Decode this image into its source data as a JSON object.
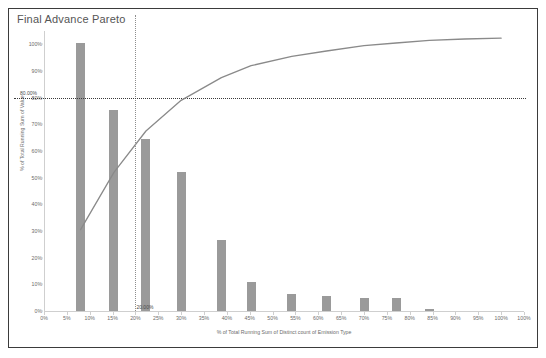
{
  "chart_title": "Final Advance Pareto",
  "axis": {
    "y_title": "% of Total Running Sum of Value",
    "x_title": "% of Total Running Sum of Distinct count of Emission Type",
    "y_ticks": [
      "0%",
      "10%",
      "20%",
      "30%",
      "40%",
      "50%",
      "60%",
      "70%",
      "80%",
      "90%",
      "100%"
    ],
    "x_ticks": [
      "0%",
      "5%",
      "10%",
      "15%",
      "20%",
      "25%",
      "30%",
      "35%",
      "40%",
      "45%",
      "50%",
      "55%",
      "60%",
      "65%",
      "70%",
      "75%",
      "80%",
      "85%",
      "90%",
      "95%",
      "100%",
      "100%"
    ]
  },
  "reference_lines": {
    "horizontal_label": "80.00%",
    "horizontal_value": 80,
    "vertical_label": "20.00%",
    "vertical_value": 20
  },
  "colors": {
    "bar": "#9a9a9a",
    "line": "#8a8a8a",
    "ref_line_h": "#3a3a3a",
    "ref_line_v": "#8e8e8e",
    "axis": "#cfcfcf",
    "text": "#6b6b6b",
    "frame": "#3b3b3b"
  },
  "chart_data": {
    "type": "bar",
    "title": "Final Advance Pareto",
    "xlabel": "% of Total Running Sum of Distinct count of Emission Type",
    "ylabel": "% of Total Running Sum of Value",
    "xlim": [
      0,
      105
    ],
    "ylim": [
      0,
      105
    ],
    "grid": false,
    "legend": "none",
    "x": [
      8,
      15.3,
      22.3,
      30.0,
      38.8,
      45.3,
      54.2,
      61.8,
      70.0,
      77.0,
      84.3
    ],
    "categories": [
      "8%",
      "15%",
      "22%",
      "30%",
      "39%",
      "45%",
      "54%",
      "62%",
      "70%",
      "77%",
      "84%"
    ],
    "series": [
      {
        "name": "% of Total Running Sum of Value",
        "type": "bar",
        "values": [
          100.5,
          75.5,
          64.5,
          52.0,
          26.5,
          11.0,
          6.5,
          5.5,
          5.0,
          5.0,
          0.6
        ]
      },
      {
        "name": "Cumulative % of Total Running Sum of Value",
        "type": "line",
        "x": [
          8.0,
          15.3,
          22.3,
          30.0,
          38.8,
          45.3,
          54.2,
          61.8,
          70.0,
          77.0,
          84.3,
          92.0,
          100.0
        ],
        "values": [
          30.5,
          52.0,
          67.5,
          79.0,
          87.5,
          92.0,
          95.5,
          97.5,
          99.5,
          100.5,
          101.5,
          102.0,
          102.3
        ]
      }
    ],
    "annotations": [
      {
        "text": "80.00%",
        "type": "horizontal-reference-line",
        "y": 80
      },
      {
        "text": "20.00%",
        "type": "vertical-reference-line",
        "x": 20
      }
    ]
  }
}
